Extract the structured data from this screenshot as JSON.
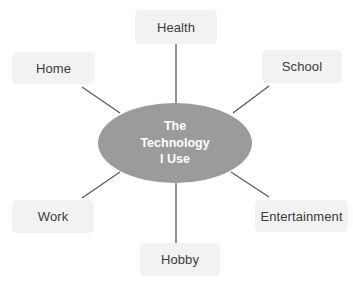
{
  "diagram": {
    "type": "hub-and-spoke radial diagram",
    "canvas": {
      "width": 353,
      "height": 285,
      "background": "#ffffff"
    },
    "colors": {
      "hub_fill": "#9b9b9b",
      "hub_text": "#ffffff",
      "node_fill": "#f2f2f2",
      "node_text": "#3b3b3b",
      "connector": "#5a5a5a"
    },
    "hub": {
      "label_lines": [
        "The",
        "Technology",
        "I Use"
      ],
      "line1": "The",
      "line2": "Technology",
      "line3": "I Use",
      "shape": "ellipse",
      "center": {
        "x": 175,
        "y": 143
      },
      "size": {
        "width": 154,
        "height": 80
      }
    },
    "nodes": [
      {
        "id": "health",
        "label": "Health",
        "position": "top",
        "box": {
          "x": 135,
          "y": 10,
          "w": 82,
          "h": 34
        },
        "connector": {
          "x1": 176,
          "y1": 44,
          "x2": 176,
          "y2": 103
        }
      },
      {
        "id": "school",
        "label": "School",
        "position": "top-right",
        "box": {
          "x": 262,
          "y": 50,
          "w": 80,
          "h": 33
        },
        "connector": {
          "x1": 269,
          "y1": 86,
          "x2": 233,
          "y2": 113
        }
      },
      {
        "id": "entertainment",
        "label": "Entertainment",
        "position": "bottom-right",
        "box": {
          "x": 255,
          "y": 200,
          "w": 93,
          "h": 32
        },
        "connector": {
          "x1": 269,
          "y1": 197,
          "x2": 231,
          "y2": 172
        }
      },
      {
        "id": "hobby",
        "label": "Hobby",
        "position": "bottom",
        "box": {
          "x": 140,
          "y": 243,
          "w": 80,
          "h": 33
        },
        "connector": {
          "x1": 176,
          "y1": 243,
          "x2": 176,
          "y2": 183
        }
      },
      {
        "id": "work",
        "label": "Work",
        "position": "bottom-left",
        "box": {
          "x": 12,
          "y": 200,
          "w": 82,
          "h": 33
        },
        "connector": {
          "x1": 82,
          "y1": 198,
          "x2": 120,
          "y2": 172
        }
      },
      {
        "id": "home",
        "label": "Home",
        "position": "top-left",
        "box": {
          "x": 12,
          "y": 52,
          "w": 83,
          "h": 32
        },
        "connector": {
          "x1": 82,
          "y1": 87,
          "x2": 120,
          "y2": 113
        }
      }
    ]
  }
}
